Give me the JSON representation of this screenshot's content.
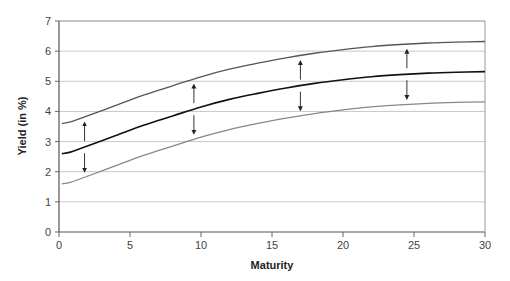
{
  "chart_data": {
    "type": "line",
    "title": "",
    "xlabel": "Maturity",
    "ylabel": "Yield (in %)",
    "xlim": [
      0,
      30
    ],
    "ylim": [
      0,
      7
    ],
    "x_ticks": [
      0,
      5,
      10,
      15,
      20,
      25,
      30
    ],
    "y_ticks": [
      0,
      1,
      2,
      3,
      4,
      5,
      6,
      7
    ],
    "grid": "horizontal",
    "legend": "none",
    "x": [
      0.2,
      0.8,
      2,
      4,
      6,
      8,
      10,
      12,
      14,
      16,
      18,
      20,
      22,
      24,
      26,
      28,
      30
    ],
    "series": [
      {
        "name": "Upper shifted curve",
        "color": "#555555",
        "values": [
          3.6,
          3.65,
          3.85,
          4.2,
          4.55,
          4.85,
          5.15,
          5.4,
          5.6,
          5.78,
          5.93,
          6.05,
          6.15,
          6.22,
          6.27,
          6.3,
          6.32
        ]
      },
      {
        "name": "Base yield curve",
        "color": "#111111",
        "values": [
          2.6,
          2.65,
          2.85,
          3.2,
          3.55,
          3.85,
          4.15,
          4.4,
          4.6,
          4.78,
          4.93,
          5.05,
          5.15,
          5.22,
          5.27,
          5.3,
          5.32
        ]
      },
      {
        "name": "Lower shifted curve",
        "color": "#888888",
        "values": [
          1.6,
          1.65,
          1.85,
          2.2,
          2.55,
          2.85,
          3.15,
          3.4,
          3.6,
          3.78,
          3.93,
          4.05,
          4.15,
          4.22,
          4.27,
          4.3,
          4.32
        ]
      }
    ],
    "annotations": [
      {
        "type": "double-arrow",
        "x": 1.8,
        "description": "parallel shift up/down"
      },
      {
        "type": "double-arrow",
        "x": 9.5,
        "description": "parallel shift up/down"
      },
      {
        "type": "double-arrow",
        "x": 17,
        "description": "parallel shift up/down"
      },
      {
        "type": "double-arrow",
        "x": 24.5,
        "description": "parallel shift up/down"
      }
    ]
  }
}
